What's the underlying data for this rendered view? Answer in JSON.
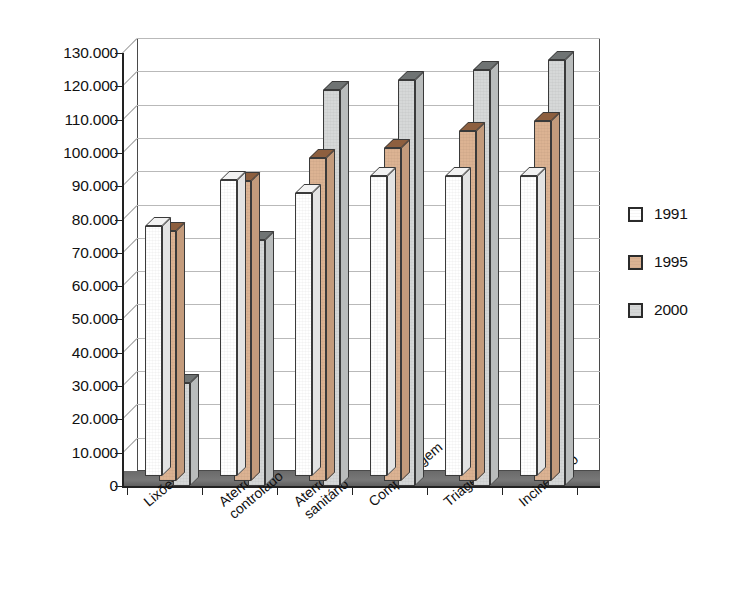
{
  "chart_data": {
    "type": "bar",
    "title": "",
    "subtitle": "",
    "xlabel": "",
    "ylabel": "",
    "ylim": [
      0,
      130000
    ],
    "ytick_step": 10000,
    "grid": true,
    "legend_position": "right",
    "number_format": "pt-BR (period as thousands separator)",
    "categories": [
      "Lixões",
      "Aterro controlado",
      "Aterro sanitário",
      "Compostagem",
      "Triagem",
      "Incineração"
    ],
    "category_lines": [
      [
        "Lixões"
      ],
      [
        "Aterro",
        "controlado"
      ],
      [
        "Aterro",
        "sanitário"
      ],
      [
        "Compostagem"
      ],
      [
        "Triagem"
      ],
      [
        "Incineração"
      ]
    ],
    "series": [
      {
        "name": "1991",
        "color": "#ffffff",
        "values": [
          75000,
          89000,
          85000,
          90000,
          90000,
          90000
        ]
      },
      {
        "name": "1995",
        "color": "#dcb393",
        "values": [
          75000,
          90000,
          97000,
          100000,
          105000,
          108000
        ]
      },
      {
        "name": "2000",
        "color": "#d6d8d8",
        "values": [
          31000,
          74000,
          119000,
          122000,
          125000,
          128000
        ]
      }
    ],
    "ytick_labels": [
      "0",
      "10.000",
      "20.000",
      "30.000",
      "40.000",
      "50.000",
      "60.000",
      "70.000",
      "80.000",
      "90.000",
      "100.000",
      "110.000",
      "120.000",
      "130.000"
    ],
    "ytick_values": [
      0,
      10000,
      20000,
      30000,
      40000,
      50000,
      60000,
      70000,
      80000,
      90000,
      100000,
      110000,
      120000,
      130000
    ]
  },
  "legend": {
    "items": [
      {
        "label": "1991",
        "color": "#ffffff"
      },
      {
        "label": "1995",
        "color": "#dcb393"
      },
      {
        "label": "2000",
        "color": "#d6d8d8"
      }
    ]
  }
}
